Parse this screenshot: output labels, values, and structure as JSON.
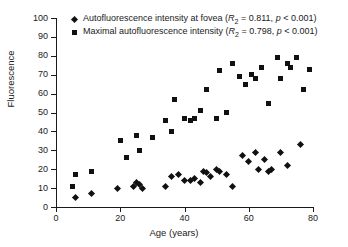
{
  "chart_data": {
    "type": "scatter",
    "title": "",
    "xlabel": "Age (years)",
    "ylabel": "Fluorescence",
    "xlim": [
      0,
      80
    ],
    "ylim": [
      0,
      100
    ],
    "xticks": [
      0,
      20,
      40,
      60,
      80
    ],
    "yticks": [
      0,
      10,
      20,
      30,
      40,
      50,
      60,
      70,
      80,
      90,
      100
    ],
    "grid": false,
    "legend_position": "top-left-inside",
    "series": [
      {
        "name": "Autofluorescence intensity at fovea",
        "marker": "diamond",
        "color": "#111111",
        "stat_symbol": "R",
        "stat_subscript": "2",
        "stat_value": "0.811",
        "p_text": "p < 0.001",
        "legend_label": "Autofluorescence intensity at fovea (R₂ = 0.811, p < 0.001)",
        "points": [
          {
            "x": 6,
            "y": 5
          },
          {
            "x": 11,
            "y": 7
          },
          {
            "x": 19,
            "y": 10
          },
          {
            "x": 24,
            "y": 11
          },
          {
            "x": 25,
            "y": 13
          },
          {
            "x": 26,
            "y": 12
          },
          {
            "x": 27,
            "y": 10
          },
          {
            "x": 34,
            "y": 11
          },
          {
            "x": 36,
            "y": 16
          },
          {
            "x": 38,
            "y": 17
          },
          {
            "x": 40,
            "y": 14
          },
          {
            "x": 42,
            "y": 14
          },
          {
            "x": 43,
            "y": 15
          },
          {
            "x": 45,
            "y": 13
          },
          {
            "x": 46,
            "y": 19
          },
          {
            "x": 47,
            "y": 18
          },
          {
            "x": 48,
            "y": 16
          },
          {
            "x": 50,
            "y": 20
          },
          {
            "x": 51,
            "y": 19
          },
          {
            "x": 53,
            "y": 17
          },
          {
            "x": 55,
            "y": 11
          },
          {
            "x": 58,
            "y": 27
          },
          {
            "x": 60,
            "y": 24
          },
          {
            "x": 62,
            "y": 29
          },
          {
            "x": 63,
            "y": 20
          },
          {
            "x": 65,
            "y": 25
          },
          {
            "x": 66,
            "y": 19
          },
          {
            "x": 67,
            "y": 20
          },
          {
            "x": 70,
            "y": 29
          },
          {
            "x": 72,
            "y": 22
          },
          {
            "x": 76,
            "y": 33
          }
        ]
      },
      {
        "name": "Maximal autofluorescence intensity",
        "marker": "square",
        "color": "#111111",
        "stat_symbol": "R",
        "stat_subscript": "2",
        "stat_value": "0.798",
        "p_text": "p < 0.001",
        "legend_label": "Maximal autofluorescence intensity (R₂ = 0.798, p < 0.001)",
        "points": [
          {
            "x": 5,
            "y": 11
          },
          {
            "x": 6,
            "y": 17
          },
          {
            "x": 11,
            "y": 19
          },
          {
            "x": 20,
            "y": 35
          },
          {
            "x": 22,
            "y": 26
          },
          {
            "x": 25,
            "y": 38
          },
          {
            "x": 26,
            "y": 30
          },
          {
            "x": 30,
            "y": 37
          },
          {
            "x": 34,
            "y": 46
          },
          {
            "x": 36,
            "y": 40
          },
          {
            "x": 37,
            "y": 57
          },
          {
            "x": 40,
            "y": 47
          },
          {
            "x": 42,
            "y": 46
          },
          {
            "x": 43,
            "y": 47
          },
          {
            "x": 45,
            "y": 51
          },
          {
            "x": 47,
            "y": 62
          },
          {
            "x": 50,
            "y": 47
          },
          {
            "x": 51,
            "y": 72
          },
          {
            "x": 53,
            "y": 50
          },
          {
            "x": 55,
            "y": 76
          },
          {
            "x": 57,
            "y": 69
          },
          {
            "x": 59,
            "y": 65
          },
          {
            "x": 61,
            "y": 70
          },
          {
            "x": 62,
            "y": 68
          },
          {
            "x": 64,
            "y": 74
          },
          {
            "x": 66,
            "y": 55
          },
          {
            "x": 69,
            "y": 79
          },
          {
            "x": 70,
            "y": 68
          },
          {
            "x": 72,
            "y": 76
          },
          {
            "x": 73,
            "y": 74
          },
          {
            "x": 75,
            "y": 79
          },
          {
            "x": 77,
            "y": 62
          },
          {
            "x": 79,
            "y": 73
          }
        ]
      }
    ]
  }
}
